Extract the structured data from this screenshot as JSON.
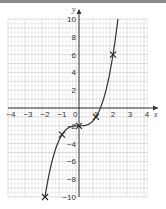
{
  "chart_data": {
    "type": "line",
    "title": "",
    "xlabel": "x",
    "ylabel": "y",
    "xlim": [
      -4,
      4
    ],
    "ylim": [
      -10,
      10
    ],
    "x_ticks": [
      "-4",
      "-3",
      "-2",
      "-1",
      "0",
      "1",
      "2",
      "3",
      "4"
    ],
    "y_ticks": [
      "10",
      "8",
      "6",
      "4",
      "2",
      "-2",
      "-4",
      "-6",
      "-8",
      "-10"
    ],
    "origin_label": "0",
    "grid": true,
    "function": "y = x^3 - 2",
    "series": [
      {
        "name": "curve",
        "marked_points": [
          {
            "x": -2,
            "y": -10
          },
          {
            "x": -1,
            "y": -3
          },
          {
            "x": 0,
            "y": -2
          },
          {
            "x": 1,
            "y": -1
          },
          {
            "x": 2,
            "y": 6
          }
        ]
      }
    ]
  }
}
